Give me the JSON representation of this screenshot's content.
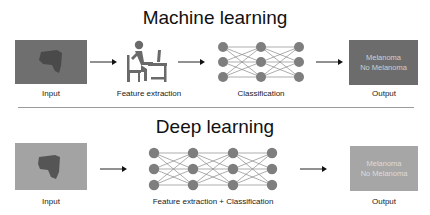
{
  "colors": {
    "ml_input_bg": "#6f6f6f",
    "ml_lesion": "#4a4a4a",
    "ml_output_bg": "#6c6c6c",
    "dl_input_bg": "#a3a3a3",
    "dl_lesion": "#555555",
    "dl_output_bg": "#a6a6a6",
    "node": "#7e7e7e",
    "edge": "#8a8a8a",
    "icon": "#6a6a6a",
    "separator": "#9a9a9a"
  },
  "machine_learning": {
    "title": "Machine learning",
    "steps": [
      {
        "id": "input",
        "label": "Input"
      },
      {
        "id": "feature_extraction",
        "label": "Feature extraction",
        "icon": "person-at-computer-icon"
      },
      {
        "id": "classification",
        "label": "Classification",
        "icon": "neural-network-icon",
        "layers": [
          3,
          3,
          3
        ]
      },
      {
        "id": "output",
        "label": "Output",
        "lines": [
          "Melanoma",
          "No Melanoma"
        ]
      }
    ]
  },
  "deep_learning": {
    "title": "Deep learning",
    "steps": [
      {
        "id": "input",
        "label": "Input"
      },
      {
        "id": "feature_extraction_classification",
        "label": "Feature extraction + Classification",
        "icon": "neural-network-icon",
        "layers": [
          3,
          3,
          3,
          3
        ]
      },
      {
        "id": "output",
        "label": "Output",
        "lines": [
          "Melanoma",
          "No Melanoma"
        ]
      }
    ]
  }
}
